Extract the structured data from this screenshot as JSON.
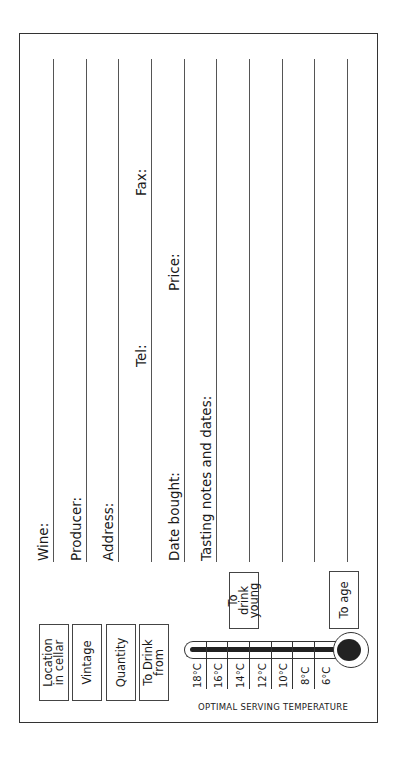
{
  "card": {
    "fields": [
      {
        "label": "Wine:"
      },
      {
        "label": "Producer:"
      },
      {
        "label": "Address:"
      },
      {
        "label": ""
      },
      {
        "label": "Date bought:"
      },
      {
        "label": "Tasting notes and dates:"
      },
      {
        "label": ""
      },
      {
        "label": ""
      },
      {
        "label": ""
      },
      {
        "label": ""
      }
    ],
    "inline_labels": {
      "tel": "Tel:",
      "fax": "Fax:",
      "price": "Price:"
    },
    "side_boxes": [
      {
        "label": "Location in cellar"
      },
      {
        "label": "Vintage"
      },
      {
        "label": "Quantity"
      },
      {
        "label": "To Drink from"
      }
    ],
    "thermometer": {
      "caption": "OPTIMAL SERVING TEMPERATURE",
      "temperatures": [
        "18°C",
        "16°C",
        "14°C",
        "12°C",
        "10°C",
        "8°C",
        "6°C"
      ],
      "marker_young": "To drink young",
      "marker_age": "To age"
    }
  }
}
